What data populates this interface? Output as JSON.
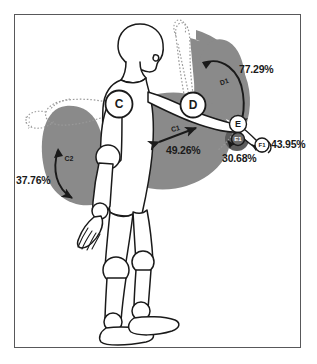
{
  "colors": {
    "frame_border": "#58585a",
    "background": "#ffffff",
    "sector_gray": "#8a8a8a",
    "sector_dark_gray": "#5d5d5d",
    "outline": "#1a1a1a",
    "dotted_outline": "#9a9a9a",
    "text": "#1a1a1a"
  },
  "joint_markers": [
    {
      "id": "C",
      "label": "C",
      "name": "left-shoulder-joint-marker",
      "x": 119,
      "y": 104,
      "r": 13.5,
      "fill": "#ffffff",
      "font_size": 12
    },
    {
      "id": "D",
      "label": "D",
      "name": "right-shoulder-joint-marker",
      "x": 193,
      "y": 105,
      "r": 12.5,
      "fill": "#ffffff",
      "font_size": 12
    },
    {
      "id": "E",
      "label": "E",
      "name": "right-elbow-joint-marker",
      "x": 238,
      "y": 124,
      "r": 8.5,
      "fill": "#ffffff",
      "font_size": 9
    },
    {
      "id": "E1",
      "label": "E1",
      "name": "forearm-rotation-marker",
      "x": 238,
      "y": 139,
      "r": 6.5,
      "fill": "#6a6a6a",
      "font_size": 6
    },
    {
      "id": "F1",
      "label": "F1",
      "name": "wrist-joint-marker",
      "x": 262,
      "y": 145,
      "r": 7.0,
      "fill": "#ffffff",
      "font_size": 6
    }
  ],
  "arc_labels": [
    {
      "id": "D1",
      "label": "D1",
      "name": "arc-label-d1",
      "x": 225,
      "y": 84,
      "rotation": -18,
      "font_size": 7
    },
    {
      "id": "C1",
      "label": "C1",
      "name": "arc-label-c1",
      "x": 176,
      "y": 131,
      "rotation": -14,
      "font_size": 7
    },
    {
      "id": "C2",
      "label": "C2",
      "name": "arc-label-c2",
      "x": 69,
      "y": 161,
      "rotation": 0,
      "font_size": 7
    }
  ],
  "percentages": [
    {
      "id": "d1",
      "value": "77.29%",
      "name": "percentage-label-77-29",
      "left": 239,
      "top": 63,
      "font_size": 10.5,
      "related_arc": "D1"
    },
    {
      "id": "f1",
      "value": "43.95%",
      "name": "percentage-label-43-95",
      "left": 271,
      "top": 138,
      "font_size": 10.5,
      "related_arc": "F1"
    },
    {
      "id": "e1",
      "value": "30.68%",
      "name": "percentage-label-30-68",
      "left": 222,
      "top": 152,
      "font_size": 10.5,
      "related_arc": "E1"
    },
    {
      "id": "c1",
      "value": "49.26%",
      "name": "percentage-label-49-26",
      "left": 166,
      "top": 144,
      "font_size": 10.5,
      "related_arc": "C1"
    },
    {
      "id": "c2",
      "value": "37.76%",
      "name": "percentage-label-37-76",
      "left": 16,
      "top": 174,
      "font_size": 10.5,
      "related_arc": "C2"
    }
  ],
  "sectors": [
    {
      "id": "D1",
      "name": "shoulder-flexion-sector-d1",
      "fill": "#8a8a8a",
      "description": "right shoulder overhead range wedge"
    },
    {
      "id": "C1",
      "name": "shoulder-abduction-sector-c1",
      "fill": "#8a8a8a",
      "description": "right arm forward reach ellipse"
    },
    {
      "id": "C2",
      "name": "shoulder-extension-sector-c2",
      "fill": "#8a8a8a",
      "description": "left arm raise range wedge"
    },
    {
      "id": "E1",
      "name": "forearm-rotation-sector-e1",
      "fill": "#5d5d5d",
      "description": "forearm pronation disc"
    }
  ]
}
